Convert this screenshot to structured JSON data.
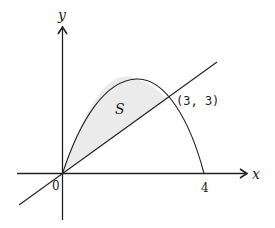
{
  "figure": {
    "axis_labels": {
      "x": "x",
      "y": "y"
    },
    "origin_label": "0",
    "x_tick_label": "4",
    "region_label": "S",
    "intersection_label": "(3, 3)",
    "colors": {
      "stroke": "#222222",
      "fill": "#ebebeb",
      "background": "#ffffff"
    },
    "curves": [
      {
        "name": "parabola",
        "equation": "y = 4x - x^2",
        "roots": [
          0,
          4
        ]
      },
      {
        "name": "line",
        "equation": "y = x"
      }
    ],
    "intersection_points": [
      [
        0,
        0
      ],
      [
        3,
        3
      ]
    ]
  }
}
